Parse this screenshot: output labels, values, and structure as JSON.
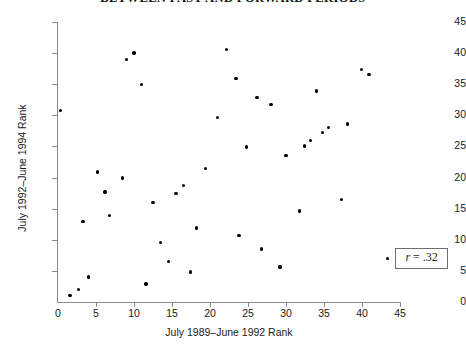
{
  "chart_data": {
    "type": "scatter",
    "title": "BETWEEN PAST AND FORWARD PERIODS",
    "xlabel": "July 1989–June 1992 Rank",
    "ylabel": "July 1992–June 1994 Rank",
    "xlim": [
      0,
      45
    ],
    "ylim": [
      0,
      45
    ],
    "xticks": [
      0,
      5,
      10,
      15,
      20,
      25,
      30,
      35,
      40,
      45
    ],
    "yticks": [
      0,
      5,
      10,
      15,
      20,
      25,
      30,
      35,
      40,
      45
    ],
    "xticklabels": [
      "0",
      "5",
      "10",
      "15",
      "20",
      "25",
      "30",
      "35",
      "40",
      "45"
    ],
    "yticklabels": [
      "0",
      "5",
      "10",
      "15",
      "20",
      "25",
      "30",
      "35",
      "40",
      "45"
    ],
    "grid": false,
    "legend_position": "lower-right",
    "marker": "filled-circle",
    "marker_color": "#000000",
    "annotation": "r = .32",
    "annotation_symbol": "r",
    "annotation_value": ".32",
    "points": [
      {
        "x": 0.3,
        "y": 30.8
      },
      {
        "x": 1.6,
        "y": 1.0
      },
      {
        "x": 2.7,
        "y": 2.0
      },
      {
        "x": 3.3,
        "y": 12.9
      },
      {
        "x": 4.0,
        "y": 4.0
      },
      {
        "x": 5.2,
        "y": 20.9
      },
      {
        "x": 6.2,
        "y": 17.7
      },
      {
        "x": 6.8,
        "y": 13.9
      },
      {
        "x": 8.5,
        "y": 19.9
      },
      {
        "x": 9.0,
        "y": 39.0
      },
      {
        "x": 10.0,
        "y": 40.0
      },
      {
        "x": 11.0,
        "y": 35.0
      },
      {
        "x": 11.6,
        "y": 2.9
      },
      {
        "x": 12.5,
        "y": 16.0
      },
      {
        "x": 13.5,
        "y": 9.6
      },
      {
        "x": 14.5,
        "y": 6.5
      },
      {
        "x": 15.5,
        "y": 17.4
      },
      {
        "x": 16.5,
        "y": 18.7
      },
      {
        "x": 17.4,
        "y": 4.8
      },
      {
        "x": 18.2,
        "y": 11.9
      },
      {
        "x": 19.4,
        "y": 21.5
      },
      {
        "x": 21.0,
        "y": 29.7
      },
      {
        "x": 22.2,
        "y": 40.6
      },
      {
        "x": 23.4,
        "y": 35.9
      },
      {
        "x": 23.8,
        "y": 10.7
      },
      {
        "x": 24.8,
        "y": 24.9
      },
      {
        "x": 26.2,
        "y": 32.9
      },
      {
        "x": 26.8,
        "y": 8.5
      },
      {
        "x": 28.0,
        "y": 31.7
      },
      {
        "x": 29.2,
        "y": 5.6
      },
      {
        "x": 30.0,
        "y": 23.5
      },
      {
        "x": 31.8,
        "y": 14.6
      },
      {
        "x": 32.4,
        "y": 25.1
      },
      {
        "x": 33.2,
        "y": 26.0
      },
      {
        "x": 34.0,
        "y": 33.9
      },
      {
        "x": 34.8,
        "y": 27.2
      },
      {
        "x": 35.6,
        "y": 28.0
      },
      {
        "x": 37.3,
        "y": 16.5
      },
      {
        "x": 38.1,
        "y": 28.6
      },
      {
        "x": 39.9,
        "y": 37.4
      },
      {
        "x": 40.9,
        "y": 36.6
      }
    ]
  }
}
